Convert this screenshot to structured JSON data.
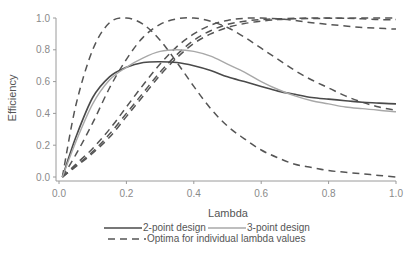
{
  "chart_data": {
    "type": "line",
    "title": "",
    "xlabel": "Lambda",
    "ylabel": "Efficiency",
    "xlim": [
      0.0,
      1.0
    ],
    "ylim": [
      0.0,
      1.0
    ],
    "xticks": [
      "0.0",
      "0.2",
      "0.4",
      "0.6",
      "0.8",
      "1.0"
    ],
    "yticks": [
      "0.0",
      "0.2",
      "0.4",
      "0.6",
      "0.8",
      "1.0"
    ],
    "grid": false,
    "legend_position": "bottom",
    "x": [
      0.01,
      0.05,
      0.1,
      0.15,
      0.2,
      0.25,
      0.3,
      0.35,
      0.4,
      0.45,
      0.5,
      0.55,
      0.6,
      0.65,
      0.7,
      0.75,
      0.8,
      0.85,
      0.9,
      0.95,
      1.0
    ],
    "series": [
      {
        "name": "2-point design",
        "style": "solid",
        "color": "#4a4a4a",
        "values": [
          0.0,
          0.25,
          0.5,
          0.63,
          0.69,
          0.72,
          0.725,
          0.72,
          0.7,
          0.67,
          0.63,
          0.6,
          0.57,
          0.54,
          0.52,
          0.5,
          0.49,
          0.48,
          0.47,
          0.465,
          0.46
        ]
      },
      {
        "name": "3-point design",
        "style": "solid",
        "color": "#a8a8a8",
        "values": [
          0.0,
          0.22,
          0.46,
          0.61,
          0.69,
          0.75,
          0.79,
          0.8,
          0.79,
          0.76,
          0.71,
          0.66,
          0.6,
          0.55,
          0.51,
          0.48,
          0.46,
          0.44,
          0.43,
          0.42,
          0.41
        ]
      },
      {
        "name": "Optima for individual lambda values (lambda=0.2)",
        "style": "dashed",
        "color": "#555555",
        "values": [
          0.0,
          0.45,
          0.8,
          0.97,
          1.0,
          0.96,
          0.86,
          0.72,
          0.57,
          0.43,
          0.32,
          0.24,
          0.17,
          0.12,
          0.08,
          0.06,
          0.04,
          0.03,
          0.02,
          0.01,
          0.0
        ]
      },
      {
        "name": "Optima for individual lambda values (lambda=0.4)",
        "style": "dashed",
        "color": "#555555",
        "values": [
          0.0,
          0.14,
          0.34,
          0.56,
          0.74,
          0.88,
          0.96,
          0.995,
          1.0,
          0.98,
          0.94,
          0.88,
          0.81,
          0.74,
          0.67,
          0.61,
          0.56,
          0.51,
          0.47,
          0.44,
          0.42
        ]
      },
      {
        "name": "Optima for individual lambda values (lambda=0.6)",
        "style": "dashed",
        "color": "#555555",
        "values": [
          0.0,
          0.08,
          0.18,
          0.3,
          0.44,
          0.58,
          0.71,
          0.82,
          0.9,
          0.955,
          0.985,
          0.998,
          1.0,
          0.995,
          0.985,
          0.97,
          0.96,
          0.95,
          0.94,
          0.935,
          0.93
        ]
      },
      {
        "name": "Optima for individual lambda values (lambda=0.8)",
        "style": "dashed",
        "color": "#555555",
        "values": [
          0.0,
          0.07,
          0.16,
          0.27,
          0.4,
          0.53,
          0.66,
          0.77,
          0.86,
          0.92,
          0.96,
          0.98,
          0.99,
          0.995,
          0.998,
          1.0,
          1.0,
          0.998,
          0.995,
          0.99,
          0.99
        ]
      },
      {
        "name": "Optima for individual lambda values (lambda=1.0)",
        "style": "dashed",
        "color": "#555555",
        "values": [
          0.0,
          0.065,
          0.15,
          0.25,
          0.38,
          0.51,
          0.64,
          0.75,
          0.84,
          0.9,
          0.94,
          0.965,
          0.98,
          0.99,
          0.995,
          0.997,
          0.998,
          0.999,
          1.0,
          1.0,
          1.0
        ]
      }
    ]
  },
  "legend": {
    "item1": "2-point design",
    "item2": "3-point design",
    "item3": "Optima for individual lambda values"
  },
  "axes": {
    "xlabel": "Lambda",
    "ylabel": "Efficiency"
  }
}
